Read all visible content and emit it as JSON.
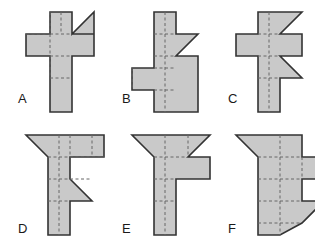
{
  "figure": {
    "type": "multi-panel-shape-diagram",
    "background_color": "#ffffff",
    "fill_color": "#c9c9c9",
    "stroke_color": "#333333",
    "grid_line_color": "#666666",
    "grid_line_style": "dashed",
    "stroke_width": 1.6,
    "unit_cell_px": 22,
    "canvas": {
      "width": 315,
      "height": 245
    },
    "columns": 3,
    "rows": 2
  },
  "shapes": [
    {
      "id": "shape-a",
      "label": "A",
      "label_x": 18,
      "label_y": 92,
      "origin_x": 24,
      "origin_y": 10,
      "width": 78,
      "height": 100,
      "outline": "M 24,0 L 46,0 L 46,22 L 68,0 L 68,22 L 46,22 L 68,22 L 68,44 L 46,44 L 46,66 L 46,100 L 24,100 L 24,44 L 0,44 L 0,22 L 24,22 Z",
      "outline_points": "24,0 46,0 46,22 68,0 68,22 46,22 68,22 68,44 46,44 46,100 24,100 24,44 0,44 0,22 24,22",
      "grid_lines": [
        "M 24,22 L 46,22",
        "M 0,22 L 24,22",
        "M 24,44 L 46,44",
        "M 24,66 L 46,66",
        "M 24,0 L 24,44",
        "M 35,0 L 35,22",
        "M 24,44 L 24,66"
      ]
    },
    {
      "id": "shape-b",
      "label": "B",
      "label_x": 122,
      "label_y": 92,
      "origin_x": 130,
      "origin_y": 10,
      "width": 78,
      "height": 100,
      "outline_points": "22,0 44,0 44,22 66,22 44,44 66,44 66,66 66,66 66,100 22,100 22,78 0,78 0,56 22,56",
      "grid_lines": [
        "M 22,22 L 44,22",
        "M 22,44 L 44,44",
        "M 22,56 L 44,56",
        "M 22,78 L 44,78",
        "M 0,56 L 0,78",
        "M 33,0 L 33,100"
      ]
    },
    {
      "id": "shape-c",
      "label": "C",
      "label_x": 228,
      "label_y": 92,
      "origin_x": 234,
      "origin_y": 10,
      "width": 78,
      "height": 100,
      "outline_points": "22,0 66,0 44,22 66,22 66,44 44,44 66,66 44,66 44,100 22,100 22,44 0,44 0,22 22,22",
      "grid_lines": [
        "M 22,22 L 44,22",
        "M 22,44 L 44,44",
        "M 22,66 L 44,66",
        "M 33,0 L 33,100"
      ]
    },
    {
      "id": "shape-d",
      "label": "D",
      "label_x": 18,
      "label_y": 222,
      "origin_x": 24,
      "origin_y": 133,
      "width": 78,
      "height": 100,
      "outline_points": "22,0 78,0 78,22 44,22 44,44 66,66 44,66 44,88 44,100 22,100 22,22 0,0",
      "grid_lines": [
        "M 22,22 L 78,22",
        "M 22,44 L 66,44",
        "M 22,66 L 44,66",
        "M 44,0 L 44,22",
        "M 66,0 L 66,22",
        "M 33,0 L 33,100"
      ]
    },
    {
      "id": "shape-e",
      "label": "E",
      "label_x": 122,
      "label_y": 222,
      "origin_x": 130,
      "origin_y": 133,
      "width": 78,
      "height": 100,
      "outline_points": "0,0 78,0 56,22 78,22 78,44 44,44 44,100 22,100 22,22",
      "grid_lines": [
        "M 22,22 L 56,22",
        "M 22,44 L 44,44",
        "M 22,66 L 44,66",
        "M 33,0 L 33,100",
        "M 56,0 L 56,22"
      ]
    },
    {
      "id": "shape-f",
      "label": "F",
      "label_x": 228,
      "label_y": 222,
      "origin_x": 234,
      "origin_y": 133,
      "width": 78,
      "height": 100,
      "outline_points": "22,0 66,0 66,22 88,22 88,44 66,44 66,66 88,66 66,88 44,100 22,100 22,22 0,0",
      "grid_lines": [
        "M 22,22 L 66,22",
        "M 22,44 L 66,44",
        "M 22,66 L 66,66",
        "M 22,88 L 66,88",
        "M 44,0 L 44,100",
        "M 66,22 L 66,44"
      ]
    }
  ]
}
